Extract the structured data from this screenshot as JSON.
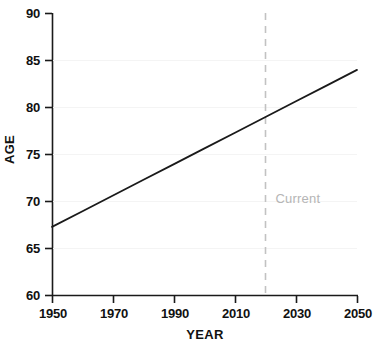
{
  "chart_data": {
    "type": "line",
    "title": "",
    "subtitle": "",
    "xlabel": "YEAR",
    "ylabel": "AGE",
    "xlim": [
      1950,
      2050
    ],
    "ylim": [
      60,
      90
    ],
    "xticks": [
      1950,
      1970,
      1990,
      2010,
      2030,
      2050
    ],
    "xtick_labels": [
      "1950",
      "1970",
      "1990",
      "2010",
      "2030",
      "2050"
    ],
    "yticks": [
      60,
      65,
      70,
      75,
      80,
      85,
      90
    ],
    "ytick_labels": [
      "60",
      "65",
      "70",
      "75",
      "80",
      "85",
      "90"
    ],
    "grid": false,
    "legend": null,
    "series": [
      {
        "name": "Life expectancy",
        "color": "#1a1a1a",
        "line_width": 1.8,
        "style": "solid",
        "x": [
          1950,
          1960,
          1970,
          1980,
          1990,
          2000,
          2010,
          2020,
          2030,
          2040,
          2050
        ],
        "values": [
          67.3,
          68.97,
          70.64,
          72.31,
          73.98,
          75.65,
          77.32,
          78.99,
          80.66,
          82.33,
          84.0
        ]
      }
    ],
    "annotations": [
      {
        "name": "current-marker",
        "label": "Current",
        "x": 2020,
        "style": "dashed-vertical-line",
        "color": "#c2c2c2",
        "label_color": "#b5b5b5",
        "label_y": 70.2
      }
    ],
    "axis_color": "#1a1a1a"
  }
}
